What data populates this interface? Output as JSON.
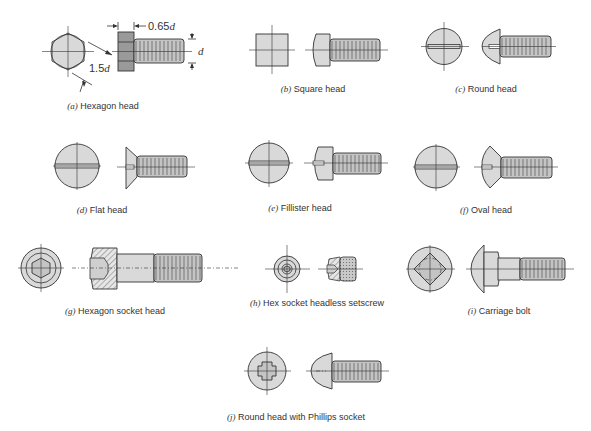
{
  "figure": {
    "dimensions": {
      "head_height": "0.65",
      "head_height_var": "d",
      "across_flats": "1.5",
      "across_flats_var": "d",
      "diameter_var": "d"
    },
    "panels": [
      {
        "letter": "(a)",
        "label": "Hexagon head"
      },
      {
        "letter": "(b)",
        "label": "Square head"
      },
      {
        "letter": "(c)",
        "label": "Round head"
      },
      {
        "letter": "(d)",
        "label": "Flat head"
      },
      {
        "letter": "(e)",
        "label": "Fillister head"
      },
      {
        "letter": "(f)",
        "label": "Oval head"
      },
      {
        "letter": "(g)",
        "label": "Hexagon socket head"
      },
      {
        "letter": "(h)",
        "label": "Hex socket headless setscrew"
      },
      {
        "letter": "(i)",
        "label": "Carriage bolt"
      },
      {
        "letter": "(j)",
        "label": "Round head with Phillips socket"
      }
    ]
  }
}
